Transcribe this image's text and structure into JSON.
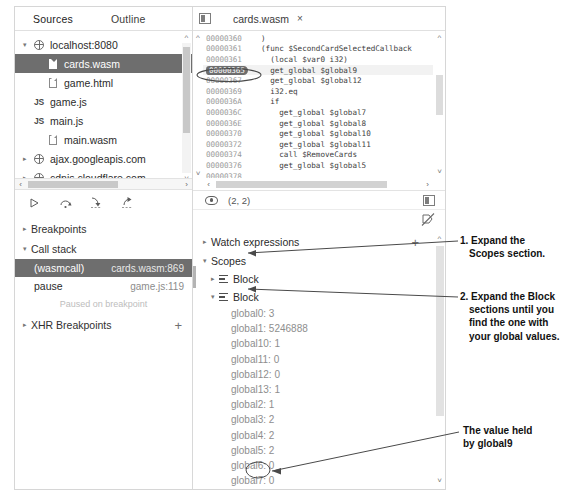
{
  "window": {
    "title": "Chrome DevTools Sources panel"
  },
  "navigator": {
    "tabs": [
      {
        "label": "Sources",
        "active": true
      },
      {
        "label": "Outline",
        "active": false
      }
    ],
    "tree": [
      {
        "label": "localhost:8080",
        "icon": "globe-icon",
        "twisty": "▾",
        "depth": 0,
        "selected": false
      },
      {
        "label": "cards.wasm",
        "icon": "file-icon",
        "twisty": "",
        "depth": 2,
        "selected": true
      },
      {
        "label": "game.html",
        "icon": "file-icon",
        "twisty": "",
        "depth": 2,
        "selected": false
      },
      {
        "label": "game.js",
        "icon": "js-icon",
        "twisty": "",
        "depth": 1,
        "selected": false
      },
      {
        "label": "main.js",
        "icon": "js-icon",
        "twisty": "",
        "depth": 1,
        "selected": false
      },
      {
        "label": "main.wasm",
        "icon": "file-icon",
        "twisty": "",
        "depth": 2,
        "selected": false
      },
      {
        "label": "ajax.googleapis.com",
        "icon": "globe-icon",
        "twisty": "▸",
        "depth": 0,
        "selected": false
      },
      {
        "label": "cdnjs.cloudflare.com",
        "icon": "globe-icon",
        "twisty": "▸",
        "depth": 0,
        "selected": false
      },
      {
        "label": "maxcdn.bootstrapcdn.com",
        "icon": "globe-icon",
        "twisty": "▸",
        "depth": 0,
        "selected": false
      }
    ]
  },
  "debugger_controls": [
    {
      "name": "resume-button",
      "icon": "play-icon"
    },
    {
      "name": "step-over-button",
      "icon": "step-over-icon"
    },
    {
      "name": "step-into-button",
      "icon": "step-into-icon"
    },
    {
      "name": "step-out-button",
      "icon": "step-out-icon"
    }
  ],
  "sidebar": {
    "breakpoints_label": "Breakpoints",
    "breakpoints_twisty": "▸",
    "call_stack_label": "Call stack",
    "call_stack_twisty": "▾",
    "call_stack": [
      {
        "fn": "(wasmcall)",
        "location": "cards.wasm:869",
        "selected": true
      },
      {
        "fn": "pause",
        "location": "game.js:119",
        "selected": false
      }
    ],
    "paused_note": "Paused on breakpoint",
    "xhr_label": "XHR Breakpoints",
    "xhr_twisty": "▸",
    "xhr_add": "+"
  },
  "editor": {
    "tab_label": "cards.wasm",
    "tab_close": "×",
    "panel_icon": "show-navigator-icon",
    "status_position": "(2, 2)",
    "lines": [
      {
        "addr": "00000360",
        "text": ")",
        "current": false
      },
      {
        "addr": "00000361",
        "text": "(func $SecondCardSelectedCallback",
        "current": false
      },
      {
        "addr": "00000361",
        "text": "  (local $var0 i32)",
        "current": false
      },
      {
        "addr": "00000365",
        "text": "  get_global $global9",
        "current": true
      },
      {
        "addr": "00000367",
        "text": "  get_global $global12",
        "current": false
      },
      {
        "addr": "00000369",
        "text": "  i32.eq",
        "current": false
      },
      {
        "addr": "0000036A",
        "text": "  if",
        "current": false
      },
      {
        "addr": "0000036C",
        "text": "    get_global $global7",
        "current": false
      },
      {
        "addr": "0000036E",
        "text": "    get_global $global8",
        "current": false
      },
      {
        "addr": "00000370",
        "text": "    get_global $global10",
        "current": false
      },
      {
        "addr": "00000372",
        "text": "    get_global $global11",
        "current": false
      },
      {
        "addr": "00000374",
        "text": "    call $RemoveCards",
        "current": false
      },
      {
        "addr": "00000376",
        "text": "    get_global $global5",
        "current": false
      },
      {
        "addr": "00000378",
        "text": "",
        "current": false
      }
    ]
  },
  "scope_pane": {
    "watch_label": "Watch expressions",
    "watch_twisty": "▸",
    "watch_add": "+",
    "scopes_label": "Scopes",
    "scopes_twisty": "▾",
    "blocks": [
      {
        "label": "Block",
        "twisty": "▸",
        "expanded": false
      },
      {
        "label": "Block",
        "twisty": "▾",
        "expanded": true
      }
    ],
    "globals": [
      {
        "name": "global0",
        "value": "3"
      },
      {
        "name": "global1",
        "value": "5246888"
      },
      {
        "name": "global10",
        "value": "1"
      },
      {
        "name": "global11",
        "value": "0"
      },
      {
        "name": "global12",
        "value": "0"
      },
      {
        "name": "global13",
        "value": "1"
      },
      {
        "name": "global2",
        "value": "1"
      },
      {
        "name": "global3",
        "value": "2"
      },
      {
        "name": "global4",
        "value": "2"
      },
      {
        "name": "global5",
        "value": "2"
      },
      {
        "name": "global6",
        "value": "0"
      },
      {
        "name": "global7",
        "value": "0"
      },
      {
        "name": "global8",
        "value": "0"
      },
      {
        "name": "global9",
        "value": "1"
      }
    ]
  },
  "annotations": [
    {
      "id": "anno1",
      "line1": "1. Expand the",
      "line2": "Scopes section."
    },
    {
      "id": "anno2",
      "line1": "2. Expand the Block",
      "line2": "sections until you",
      "line3": "find the one with",
      "line4": "your global values."
    },
    {
      "id": "anno3",
      "line1": "The value held",
      "line2": "by global9"
    }
  ],
  "colors": {
    "selection_bg": "#6e6e6e",
    "text": "#2b2b2b",
    "muted": "#8e8e8e",
    "border": "#d6d6d6",
    "current_line_bg": "#f2f2f2"
  }
}
